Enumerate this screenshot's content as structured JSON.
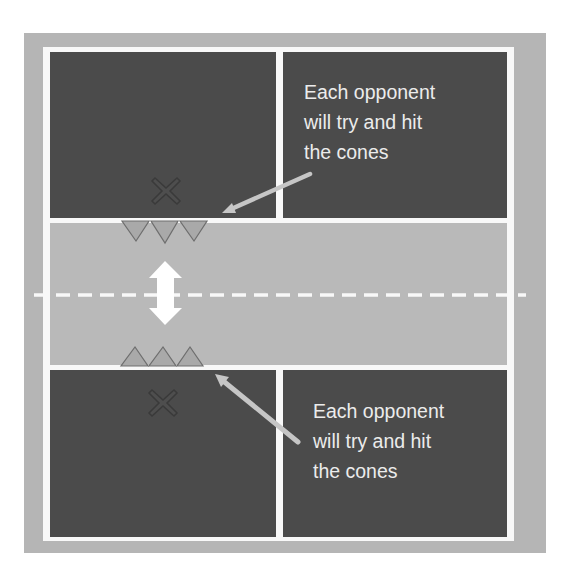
{
  "diagram": {
    "type": "drill-field-diagram",
    "colors": {
      "outer_border": "#b5b5b5",
      "court": "#4b4b4b",
      "middle_zone": "#b9b9b9",
      "lines": "#f8f8f8",
      "cone_fill": "#a9a9a9",
      "cone_outline": "#6e6e6e",
      "pointer_arrow": "#c6c6c6",
      "text": "#ececec"
    },
    "annotations": {
      "top": "Each opponent\nwill try and hit\nthe cones",
      "bottom": "Each opponent\nwill try and hit\nthe cones"
    },
    "markers": {
      "player_top": "X",
      "player_bottom": "X",
      "cones_top_count": 3,
      "cones_bottom_count": 3
    }
  }
}
